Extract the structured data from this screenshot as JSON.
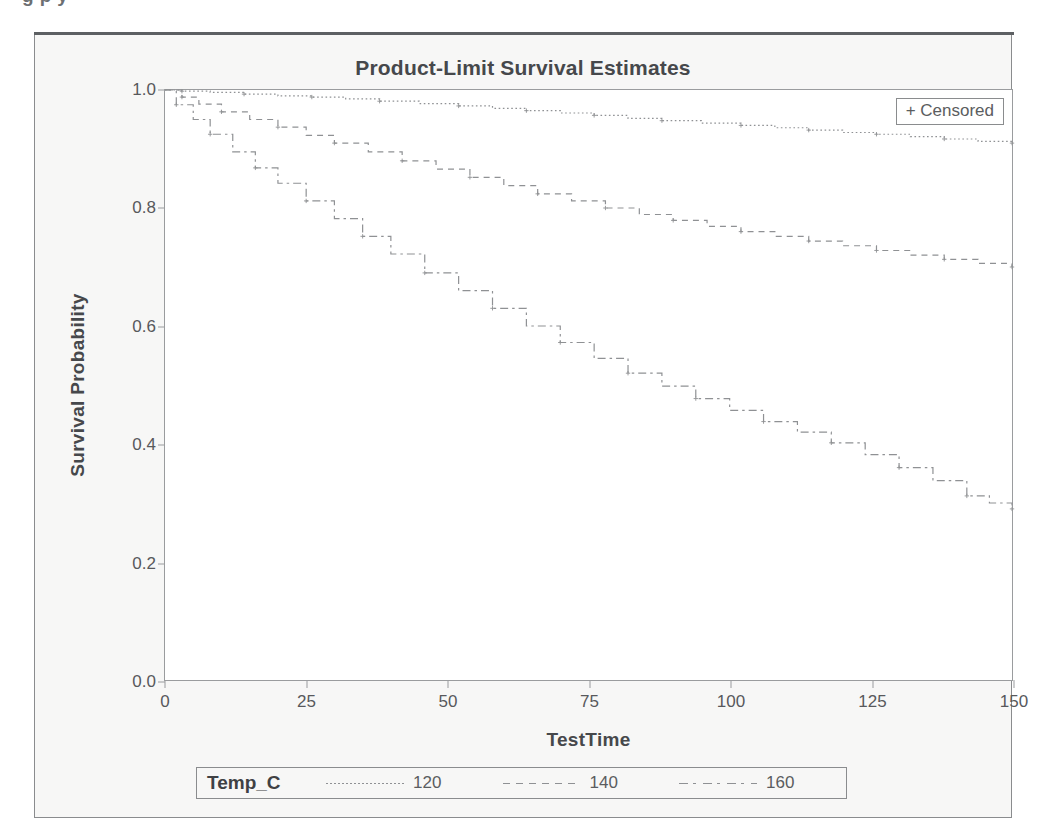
{
  "caption": {
    "text": "g             p             y"
  },
  "chart": {
    "title": "Product-Limit Survival Estimates",
    "censored_legend": "+ Censored",
    "legend_title": "Temp_C",
    "xlabel": "TestTime",
    "ylabel": "Survival Probability"
  },
  "chart_data": {
    "type": "line",
    "title": "Product-Limit Survival Estimates",
    "subtitle": "",
    "xlabel": "TestTime",
    "ylabel": "Survival Probability",
    "xlim": [
      0,
      150
    ],
    "ylim": [
      0.0,
      1.0
    ],
    "xticks": [
      0,
      25,
      50,
      75,
      100,
      125,
      150
    ],
    "yticks": [
      0.0,
      0.2,
      0.4,
      0.6,
      0.8,
      1.0
    ],
    "grid": false,
    "legend_title": "Temp_C",
    "legend_position": "bottom",
    "annotations": [
      "+ Censored"
    ],
    "step_plot": true,
    "series": [
      {
        "name": "120",
        "linestyle": "dotted",
        "color": "#8f9194",
        "x": [
          0,
          3,
          8,
          14,
          20,
          26,
          32,
          38,
          45,
          52,
          58,
          64,
          70,
          76,
          82,
          88,
          95,
          102,
          108,
          114,
          120,
          126,
          132,
          138,
          144,
          150
        ],
        "y": [
          1.0,
          0.998,
          0.996,
          0.993,
          0.99,
          0.988,
          0.985,
          0.981,
          0.977,
          0.973,
          0.969,
          0.965,
          0.961,
          0.957,
          0.952,
          0.948,
          0.944,
          0.94,
          0.936,
          0.932,
          0.928,
          0.925,
          0.921,
          0.917,
          0.913,
          0.91
        ]
      },
      {
        "name": "140",
        "linestyle": "dashed",
        "color": "#8f9194",
        "x": [
          0,
          3,
          6,
          10,
          15,
          20,
          25,
          30,
          36,
          42,
          48,
          54,
          60,
          66,
          72,
          78,
          84,
          90,
          96,
          102,
          108,
          114,
          120,
          126,
          132,
          138,
          144,
          150
        ],
        "y": [
          1.0,
          0.988,
          0.976,
          0.963,
          0.95,
          0.937,
          0.923,
          0.91,
          0.895,
          0.88,
          0.866,
          0.852,
          0.838,
          0.824,
          0.812,
          0.8,
          0.789,
          0.779,
          0.769,
          0.76,
          0.752,
          0.744,
          0.736,
          0.728,
          0.72,
          0.713,
          0.706,
          0.7
        ]
      },
      {
        "name": "160",
        "linestyle": "dashdot",
        "color": "#8f9194",
        "x": [
          0,
          2,
          5,
          8,
          12,
          16,
          20,
          25,
          30,
          35,
          40,
          46,
          52,
          58,
          64,
          70,
          76,
          82,
          88,
          94,
          100,
          106,
          112,
          118,
          124,
          130,
          136,
          142,
          146,
          150
        ],
        "y": [
          1.0,
          0.975,
          0.95,
          0.925,
          0.895,
          0.868,
          0.842,
          0.812,
          0.782,
          0.752,
          0.722,
          0.69,
          0.66,
          0.63,
          0.6,
          0.572,
          0.545,
          0.52,
          0.498,
          0.477,
          0.457,
          0.438,
          0.42,
          0.402,
          0.382,
          0.36,
          0.338,
          0.312,
          0.3,
          0.29
        ]
      }
    ]
  }
}
